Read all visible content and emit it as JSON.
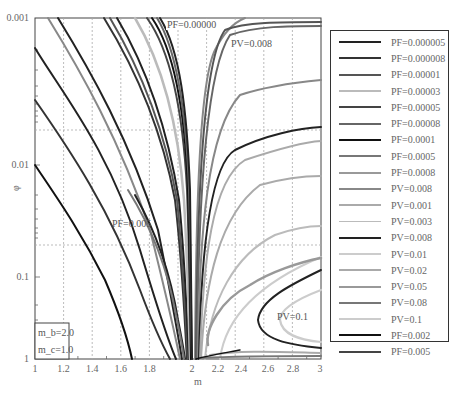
{
  "chart_data": {
    "type": "line",
    "title": "",
    "xlabel": "m",
    "ylabel": "φ",
    "xlim": [
      1,
      3
    ],
    "ylim": [
      0.001,
      1
    ],
    "y_scale": "log",
    "y_inverted": true,
    "grid": true,
    "legend_position": "right",
    "x_ticks": [
      "1",
      "1.2",
      "1.4",
      "1.6",
      "1.8",
      "2",
      "2.2",
      "2.4",
      "2.6",
      "2.8",
      "3"
    ],
    "y_ticks": [
      "0.001",
      "0.01",
      "0.1",
      "1"
    ],
    "inset_box": {
      "line1": "m_b=2.0",
      "line2": "m_c=1.0"
    },
    "annotations": [
      {
        "text": "PF=0.00000",
        "x": 1.98,
        "y": 0.001
      },
      {
        "text": "PV=0.008",
        "x": 2.3,
        "y": 0.0013
      },
      {
        "text": "PF=0.005",
        "x": 1.2,
        "y": 0.04
      },
      {
        "text": "PV=0.1",
        "x": 2.75,
        "y": 0.3
      }
    ],
    "series": [
      {
        "name": "PF=0.000005",
        "color": "#222222",
        "width": 2.0
      },
      {
        "name": "PF=0.000008",
        "color": "#333333",
        "width": 2.0
      },
      {
        "name": "PF=0.00001",
        "color": "#555555",
        "width": 2.0
      },
      {
        "name": "PF=0.00003",
        "color": "#bbbbbb",
        "width": 2.0
      },
      {
        "name": "PF=0.00005",
        "color": "#444444",
        "width": 2.0
      },
      {
        "name": "PF=0.00008",
        "color": "#666666",
        "width": 2.0
      },
      {
        "name": "PF=0.0001",
        "color": "#111111",
        "width": 2.0
      },
      {
        "name": "PF=0.0005",
        "color": "#777777",
        "width": 2.0
      },
      {
        "name": "PF=0.0008",
        "color": "#999999",
        "width": 2.0
      },
      {
        "name": "PV=0.008",
        "color": "#888888",
        "width": 2.0
      },
      {
        "name": "PV=0.001",
        "color": "#aaaaaa",
        "width": 2.0
      },
      {
        "name": "PV=0.003",
        "color": "#bbbbbb",
        "width": 1.6
      },
      {
        "name": "PV=0.008",
        "color": "#222222",
        "width": 2.0
      },
      {
        "name": "PV=0.01",
        "color": "#cccccc",
        "width": 2.0
      },
      {
        "name": "PV=0.02",
        "color": "#aaaaaa",
        "width": 2.0
      },
      {
        "name": "PV=0.05",
        "color": "#999999",
        "width": 2.5
      },
      {
        "name": "PV=0.08",
        "color": "#777777",
        "width": 2.0
      },
      {
        "name": "PV=0.1",
        "color": "#cccccc",
        "width": 2.0
      },
      {
        "name": "PF=0.002",
        "color": "#111111",
        "width": 2.0
      },
      {
        "name": "PF=0.005",
        "color": "#444444",
        "width": 2.0
      }
    ]
  },
  "legend": {
    "items": [
      {
        "label": "PF=0.000005",
        "color": "#222222",
        "width": 2
      },
      {
        "label": "PF=0.000008",
        "color": "#333333",
        "width": 2
      },
      {
        "label": "PF=0.00001",
        "color": "#555555",
        "width": 2
      },
      {
        "label": "PF=0.00003",
        "color": "#bbbbbb",
        "width": 2
      },
      {
        "label": "PF=0.00005",
        "color": "#444444",
        "width": 2
      },
      {
        "label": "PF=0.00008",
        "color": "#666666",
        "width": 2
      },
      {
        "label": "PF=0.0001",
        "color": "#111111",
        "width": 2
      },
      {
        "label": "PF=0.0005",
        "color": "#777777",
        "width": 2
      },
      {
        "label": "PF=0.0008",
        "color": "#999999",
        "width": 2
      },
      {
        "label": "PV=0.008",
        "color": "#888888",
        "width": 2
      },
      {
        "label": "PV=0.001",
        "color": "#aaaaaa",
        "width": 2
      },
      {
        "label": "PV=0.003",
        "color": "#bbbbbb",
        "width": 1.5
      },
      {
        "label": "PV=0.008",
        "color": "#222222",
        "width": 2
      },
      {
        "label": "PV=0.01",
        "color": "#cccccc",
        "width": 2
      },
      {
        "label": "PV=0.02",
        "color": "#aaaaaa",
        "width": 2
      },
      {
        "label": "PV=0.05",
        "color": "#999999",
        "width": 2.5
      },
      {
        "label": "PV=0.08",
        "color": "#777777",
        "width": 2
      },
      {
        "label": "PV=0.1",
        "color": "#cccccc",
        "width": 2
      },
      {
        "label": "PF=0.002",
        "color": "#111111",
        "width": 2
      },
      {
        "label": "PF=0.005",
        "color": "#444444",
        "width": 2
      }
    ]
  }
}
